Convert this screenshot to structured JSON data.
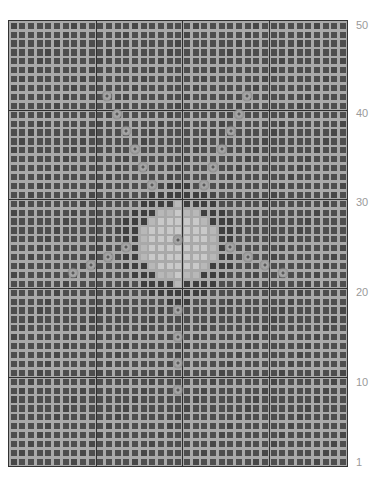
{
  "pattern": {
    "columns": 39,
    "rows": 50,
    "major_every": 10,
    "colors": {
      "grid_line": "#a9a9a9",
      "cell": "#4e4e4e",
      "cell_dark": "#3e3e3e",
      "center_patch": "#c9c9c9",
      "major_line": "#2f2f2f",
      "bead": "#a0a0a0",
      "label": "#9a9a9a"
    },
    "center_patch": {
      "col_center": 19,
      "row_center": 24.5,
      "radius": 3.6
    },
    "beads": [
      {
        "x": 107,
        "y": 96
      },
      {
        "x": 117,
        "y": 114
      },
      {
        "x": 126,
        "y": 131
      },
      {
        "x": 135,
        "y": 149
      },
      {
        "x": 143,
        "y": 167
      },
      {
        "x": 152,
        "y": 185
      },
      {
        "x": 247,
        "y": 96
      },
      {
        "x": 239,
        "y": 114
      },
      {
        "x": 231,
        "y": 131
      },
      {
        "x": 222,
        "y": 149
      },
      {
        "x": 213,
        "y": 167
      },
      {
        "x": 204,
        "y": 185
      },
      {
        "x": 73,
        "y": 273
      },
      {
        "x": 91,
        "y": 265
      },
      {
        "x": 108,
        "y": 257
      },
      {
        "x": 126,
        "y": 247
      },
      {
        "x": 230,
        "y": 247
      },
      {
        "x": 248,
        "y": 257
      },
      {
        "x": 265,
        "y": 265
      },
      {
        "x": 283,
        "y": 273
      },
      {
        "x": 178,
        "y": 240
      },
      {
        "x": 178,
        "y": 310
      },
      {
        "x": 178,
        "y": 337
      },
      {
        "x": 178,
        "y": 363
      },
      {
        "x": 178,
        "y": 390
      }
    ]
  },
  "row_labels": [
    {
      "text": "50",
      "y": 25
    },
    {
      "text": "40",
      "y": 113
    },
    {
      "text": "30",
      "y": 202
    },
    {
      "text": "20",
      "y": 292
    },
    {
      "text": "10",
      "y": 382
    },
    {
      "text": "1",
      "y": 462
    }
  ]
}
